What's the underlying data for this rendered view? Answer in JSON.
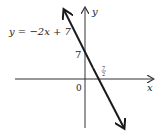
{
  "diagram": {
    "type": "linear-function-graph",
    "equation_label": "y = −2x + 7",
    "x_axis_label": "x",
    "y_axis_label": "y",
    "origin_label": "0",
    "y_intercept_label": "7",
    "x_intercept_label": {
      "numerator": "7",
      "denominator": "2"
    },
    "line": {
      "slope": -2,
      "intercept": 7,
      "arrows": "both"
    },
    "colors": {
      "line": "#1a1a1a",
      "axes": "#333333",
      "text": "#222222"
    }
  }
}
